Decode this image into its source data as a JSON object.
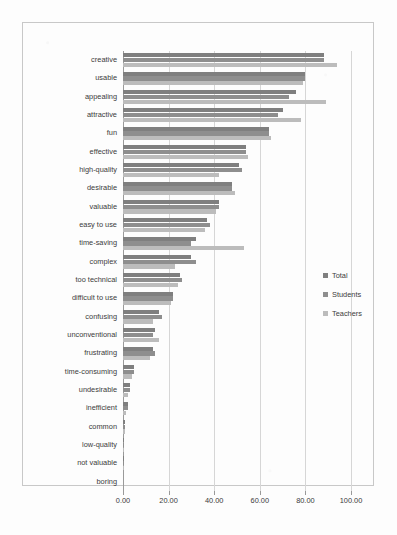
{
  "chart_data": {
    "type": "bar",
    "orientation": "horizontal",
    "title": "",
    "xlabel": "",
    "ylabel": "",
    "xlim": [
      0,
      100
    ],
    "xticks": [
      "0.00",
      "20.00",
      "40.00",
      "60.00",
      "80.00",
      "100.00"
    ],
    "xtick_values": [
      0,
      20,
      40,
      60,
      80,
      100
    ],
    "grid": true,
    "legend_position": "right",
    "categories": [
      "creative",
      "usable",
      "appealing",
      "attractive",
      "fun",
      "effective",
      "high-quality",
      "desirable",
      "valuable",
      "easy to use",
      "time-saving",
      "complex",
      "too technical",
      "difficult to use",
      "confusing",
      "unconventional",
      "frustrating",
      "time-consuming",
      "undesirable",
      "inefficient",
      "common",
      "low-quality",
      "not valuable",
      "boring"
    ],
    "series": [
      {
        "name": "Total",
        "color": "#7f7f7f",
        "values": [
          88.0,
          80.0,
          76.0,
          70.0,
          64.0,
          54.0,
          51.0,
          48.0,
          42.0,
          37.0,
          32.0,
          30.0,
          25.0,
          22.0,
          16.0,
          14.0,
          13.0,
          5.0,
          3.0,
          2.0,
          1.0,
          0.6,
          0.4,
          0.0
        ]
      },
      {
        "name": "Students",
        "color": "#8e8e8e",
        "values": [
          88.0,
          80.0,
          73.0,
          68.0,
          64.0,
          54.0,
          52.0,
          48.0,
          42.0,
          38.0,
          30.0,
          32.0,
          26.0,
          22.0,
          17.0,
          13.0,
          14.0,
          5.0,
          3.0,
          2.0,
          1.0,
          0.6,
          0.4,
          0.0
        ]
      },
      {
        "name": "Teachers",
        "color": "#bcbcbc",
        "values": [
          94.0,
          79.0,
          89.0,
          78.0,
          65.0,
          55.0,
          42.0,
          49.0,
          41.0,
          36.0,
          53.0,
          23.0,
          24.0,
          21.0,
          13.0,
          16.0,
          12.0,
          4.0,
          2.0,
          1.5,
          0.8,
          0.5,
          0.3,
          0.0
        ]
      }
    ]
  },
  "legend": {
    "items": [
      {
        "label": "Total"
      },
      {
        "label": "Students"
      },
      {
        "label": "Teachers"
      }
    ]
  }
}
